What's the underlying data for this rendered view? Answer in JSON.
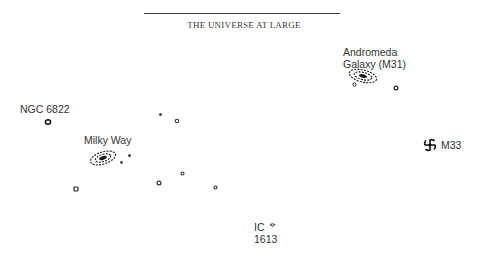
{
  "header": {
    "title": "THE UNIVERSE AT LARGE"
  },
  "labels": {
    "andromeda_line1": "Andromeda",
    "andromeda_line2": "Galaxy (M31)",
    "ngc6822": "NGC 6822",
    "milky_way": "Milky Way",
    "m33": "M33",
    "ic_line1": "IC",
    "ic_line2": "1613"
  },
  "objects": [
    {
      "name": "Andromeda Galaxy (M31)",
      "type": "spiral-galaxy",
      "x": 362,
      "y": 75
    },
    {
      "name": "M32",
      "type": "dwarf-galaxy",
      "x": 355,
      "y": 84
    },
    {
      "name": "dwarf near M31",
      "type": "dwarf-galaxy",
      "x": 396,
      "y": 88
    },
    {
      "name": "NGC 6822",
      "type": "dwarf-galaxy",
      "x": 48,
      "y": 122
    },
    {
      "name": "Milky Way",
      "type": "spiral-galaxy",
      "x": 102,
      "y": 157
    },
    {
      "name": "LMC",
      "type": "dwarf-galaxy",
      "x": 129,
      "y": 155
    },
    {
      "name": "SMC",
      "type": "dwarf-galaxy",
      "x": 121,
      "y": 162
    },
    {
      "name": "dwarf",
      "type": "dwarf-galaxy",
      "x": 160,
      "y": 114
    },
    {
      "name": "dwarf",
      "type": "dwarf-galaxy",
      "x": 176,
      "y": 120
    },
    {
      "name": "dwarf",
      "type": "dwarf-galaxy",
      "x": 182,
      "y": 173
    },
    {
      "name": "dwarf",
      "type": "dwarf-galaxy",
      "x": 159,
      "y": 183
    },
    {
      "name": "dwarf",
      "type": "dwarf-galaxy",
      "x": 215,
      "y": 187
    },
    {
      "name": "dwarf",
      "type": "dwarf-galaxy",
      "x": 76,
      "y": 189
    },
    {
      "name": "M33",
      "type": "spiral-galaxy",
      "x": 430,
      "y": 145
    },
    {
      "name": "IC 1613",
      "type": "dwarf-galaxy",
      "x": 272,
      "y": 226
    }
  ]
}
